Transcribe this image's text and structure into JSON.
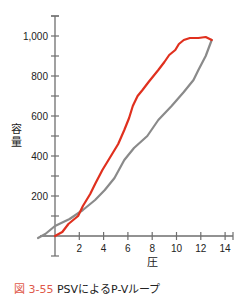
{
  "chart_data": {
    "type": "line",
    "title": "",
    "xlabel": "圧",
    "ylabel": "容量",
    "xlim": [
      -1.5,
      14.8
    ],
    "ylim": [
      -100,
      1100
    ],
    "x_ticks": [
      2,
      4,
      6,
      8,
      10,
      12,
      14
    ],
    "x_tick_labels": [
      "2",
      "4",
      "6",
      "8",
      "10",
      "12",
      "14"
    ],
    "y_ticks": [
      200,
      400,
      600,
      800,
      1000
    ],
    "y_tick_labels": [
      "200",
      "400",
      "600",
      "800",
      "1,000"
    ],
    "y_minor_ticks": [
      100,
      300,
      500,
      700,
      900,
      1100
    ],
    "grid": false,
    "legend": null,
    "series": [
      {
        "name": "inflation",
        "color": "#e0301e",
        "x": [
          0,
          0.6,
          1.1,
          1.5,
          1.9,
          2.3,
          2.9,
          3.3,
          3.9,
          4.5,
          5.2,
          5.7,
          6.1,
          6.4,
          6.8,
          7.2,
          7.7,
          8.5,
          9.0,
          9.4,
          9.9,
          10.2,
          10.6,
          11.1,
          11.8,
          12.4,
          12.9
        ],
        "y": [
          0,
          20,
          60,
          80,
          100,
          150,
          210,
          260,
          330,
          390,
          460,
          530,
          590,
          650,
          700,
          730,
          770,
          830,
          870,
          905,
          930,
          960,
          980,
          990,
          990,
          995,
          980
        ]
      },
      {
        "name": "deflation",
        "color": "#8a8a8a",
        "x": [
          -1.4,
          -0.8,
          0,
          1.2,
          2.3,
          3.3,
          4.1,
          4.9,
          5.7,
          6.5,
          7.6,
          8.5,
          9.6,
          10.6,
          11.4,
          11.8,
          12.4,
          12.9
        ],
        "y": [
          -10,
          10,
          50,
          85,
          130,
          180,
          230,
          290,
          380,
          440,
          500,
          580,
          650,
          720,
          780,
          830,
          900,
          980
        ]
      }
    ]
  },
  "caption": {
    "figure_number": "図 3-55",
    "text": "PSVによるP-Vループ"
  }
}
